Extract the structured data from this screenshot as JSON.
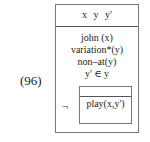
{
  "example_number": "(96)",
  "drs": {
    "referents": "x y y'",
    "conditions": [
      "john (x)",
      "variation*(y)",
      "non–at(y)",
      "y' ∈ y"
    ],
    "negation_symbol": "¬",
    "sub_drs": {
      "referents": "",
      "conditions": [
        "play(x,y')"
      ]
    }
  }
}
